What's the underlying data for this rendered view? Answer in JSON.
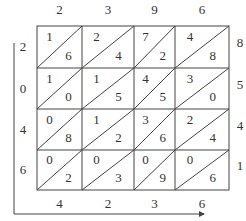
{
  "diagram": {
    "type": "lattice-multiplication",
    "top_digits": [
      "2",
      "3",
      "9",
      "6"
    ],
    "right_digits": [
      "8",
      "5",
      "4",
      "1"
    ],
    "left_digits": [
      "2",
      "0",
      "4",
      "6"
    ],
    "bottom_digits": [
      "4",
      "2",
      "3",
      "6"
    ],
    "cells": [
      [
        {
          "tens": "1",
          "ones": "6"
        },
        {
          "tens": "2",
          "ones": "4"
        },
        {
          "tens": "7",
          "ones": "2"
        },
        {
          "tens": "4",
          "ones": "8"
        }
      ],
      [
        {
          "tens": "1",
          "ones": "0"
        },
        {
          "tens": "1",
          "ones": "5"
        },
        {
          "tens": "4",
          "ones": "5"
        },
        {
          "tens": "3",
          "ones": "0"
        }
      ],
      [
        {
          "tens": "0",
          "ones": "8"
        },
        {
          "tens": "1",
          "ones": "2"
        },
        {
          "tens": "3",
          "ones": "6"
        },
        {
          "tens": "2",
          "ones": "4"
        }
      ],
      [
        {
          "tens": "0",
          "ones": "2"
        },
        {
          "tens": "0",
          "ones": "3"
        },
        {
          "tens": "0",
          "ones": "9"
        },
        {
          "tens": "0",
          "ones": "6"
        }
      ]
    ]
  }
}
